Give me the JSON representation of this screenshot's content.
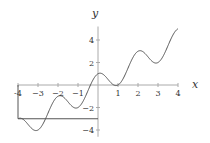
{
  "chart_data": {
    "type": "line",
    "title": "",
    "xlabel": "x",
    "ylabel": "y",
    "xlim": [
      -4,
      4
    ],
    "ylim": [
      -4,
      5
    ],
    "grid": false,
    "legend": null,
    "function": "y = x + cos(pi x)",
    "x_ticks": [
      -4,
      -3,
      -2,
      -1,
      1,
      2,
      3,
      4
    ],
    "x_tick_labels": [
      "-4",
      "−3",
      "−2",
      "−1",
      "1",
      "2",
      "3",
      "4"
    ],
    "y_ticks": [
      4,
      2,
      -2,
      -4
    ],
    "y_tick_labels": [
      "4",
      "2",
      "−2",
      "−4"
    ],
    "series": [
      {
        "name": "f(x)",
        "x": [
          -4,
          -3.5,
          -3,
          -2.5,
          -2,
          -1.5,
          -1,
          -0.5,
          0,
          0.5,
          1,
          1.5,
          2,
          2.5,
          3,
          3.5,
          4
        ],
        "values": [
          -3,
          -3.5,
          -4,
          -2.5,
          -1,
          -1.5,
          -2,
          -0.5,
          1,
          0.5,
          0,
          1.5,
          3,
          2.5,
          2,
          3.5,
          5
        ]
      }
    ],
    "annotations": [
      {
        "type": "rectangle",
        "x_from": -4,
        "x_to": 0,
        "y_from": -3,
        "y_to": 0,
        "note": "box outline from x-axis down to y=-3"
      }
    ]
  },
  "axes": {
    "x_label": "x",
    "y_label": "y"
  },
  "colors": {
    "curve": "#555555",
    "axis": "#aaaaaa",
    "box": "#555555",
    "text": "#333333"
  }
}
